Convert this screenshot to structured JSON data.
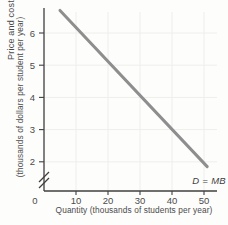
{
  "figure": {
    "y_axis_title_line1": "Price and cost",
    "y_axis_title_line2": "(thousands of dollars per student per year)",
    "x_axis_title": "Quantity (thousands of students per year)",
    "origin_label": "0"
  },
  "chart_data": {
    "type": "line",
    "title": "",
    "xlabel": "Quantity (thousands of students per year)",
    "ylabel": "Price and cost (thousands of dollars per student per year)",
    "x_ticks": [
      10,
      20,
      30,
      40,
      50
    ],
    "y_ticks": [
      2,
      3,
      4,
      5,
      6
    ],
    "xlim": [
      0,
      54
    ],
    "ylim_shown": [
      1.5,
      6.9
    ],
    "axis_break": "y-axis broken between 0 and 2",
    "grid": true,
    "legend_position": "inline-label-at-line-end",
    "series": [
      {
        "name": "D = MB",
        "points": [
          [
            5,
            6.7
          ],
          [
            51,
            1.85
          ]
        ],
        "color": "#8e8e8e"
      }
    ]
  },
  "colors": {
    "axis": "#3f3f3f",
    "tick_text": "#4b4b4b",
    "grid": "#eeeeea",
    "curve": "#8e8e8e",
    "curve_label": "#3f3f3f",
    "background": "#fdfdfc"
  }
}
